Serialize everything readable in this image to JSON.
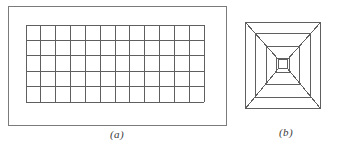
{
  "figure": {
    "background_color": "#ffffff",
    "line_color": "#6e6e6e",
    "line_color_dark": "#555555",
    "panels": [
      {
        "id": "panel-a",
        "caption": "(a)",
        "type": "rectangular-grid-in-frame",
        "frame": {
          "x": 8,
          "y": 6,
          "width": 218,
          "height": 119
        },
        "grid": {
          "x": 25,
          "y": 24,
          "width": 178,
          "height": 77,
          "columns": 12,
          "rows": 5
        }
      },
      {
        "id": "panel-b",
        "caption": "(b)",
        "type": "nested-rectangles-with-diagonals",
        "bounds": {
          "x": 245,
          "y": 22,
          "width": 75,
          "height": 86
        },
        "levels": 4,
        "center_square": {
          "x": 278,
          "y": 59,
          "width": 9,
          "height": 9
        },
        "insets": [
          0,
          10,
          21,
          31
        ]
      }
    ]
  },
  "captions": {
    "a": "(a)",
    "b": "(b)"
  }
}
